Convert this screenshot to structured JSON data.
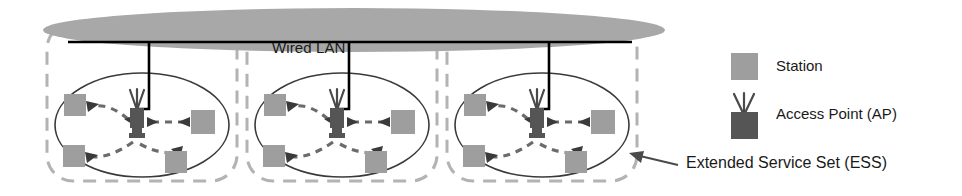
{
  "diagram": {
    "backbone": {
      "label": "Wired LAN",
      "ellipse_fill": "#a8a8a8",
      "line_color": "#000000"
    },
    "cells": [
      {
        "name": "bss-1",
        "access_point": "Access Point",
        "stations": [
          "station-top-left",
          "station-right",
          "station-bottom-left",
          "station-bottom-right"
        ]
      },
      {
        "name": "bss-2",
        "access_point": "Access Point",
        "stations": [
          "station-top-left",
          "station-right",
          "station-bottom-left",
          "station-bottom-right"
        ]
      },
      {
        "name": "bss-3",
        "access_point": "Access Point",
        "stations": [
          "station-top-left",
          "station-right",
          "station-bottom-left",
          "station-bottom-right"
        ]
      }
    ],
    "legend": {
      "station_label": "Station",
      "ap_label": "Access Point (AP)",
      "ess_label": "Extended Service Set (ESS)"
    },
    "colors": {
      "station_fill": "#9e9e9e",
      "ap_fill": "#555555",
      "ess_dashed": "#b0b0b0",
      "bss_ellipse_stroke": "#3a3a3a",
      "link_color": "#6b6b6b",
      "text": "#1a1a1a"
    }
  }
}
